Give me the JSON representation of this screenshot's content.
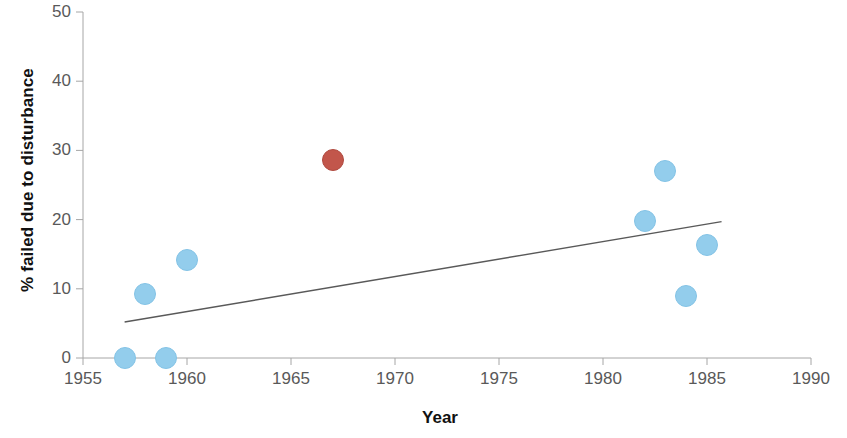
{
  "chart_data": {
    "type": "scatter",
    "title": "",
    "xlabel": "Year",
    "ylabel": "% failed due to disturbance",
    "xlim": [
      1955,
      1990
    ],
    "ylim": [
      0,
      50
    ],
    "xticks": [
      "1955",
      "1960",
      "1965",
      "1970",
      "1975",
      "1980",
      "1985",
      "1990"
    ],
    "xtick_values": [
      1955,
      1960,
      1965,
      1970,
      1975,
      1980,
      1985,
      1990
    ],
    "yticks": [
      "0",
      "10",
      "20",
      "30",
      "40",
      "50"
    ],
    "ytick_values": [
      0,
      10,
      20,
      30,
      40,
      50
    ],
    "grid": false,
    "legend": "none",
    "series": [
      {
        "name": "primary",
        "color": "#93cdec",
        "marker": "circle",
        "points": [
          {
            "x": 1957,
            "y": 0
          },
          {
            "x": 1959,
            "y": 0
          },
          {
            "x": 1958,
            "y": 9.2
          },
          {
            "x": 1960,
            "y": 14.2
          },
          {
            "x": 1982,
            "y": 19.8
          },
          {
            "x": 1983,
            "y": 27.0
          },
          {
            "x": 1984,
            "y": 8.9
          },
          {
            "x": 1985,
            "y": 16.3
          }
        ]
      },
      {
        "name": "highlighted",
        "color": "#c2564b",
        "marker": "circle",
        "points": [
          {
            "x": 1967,
            "y": 28.6
          }
        ]
      }
    ],
    "trendline": {
      "name": "linear-trend",
      "color": "#595959",
      "x_start": 1957,
      "y_start": 5.2,
      "x_end": 1985.7,
      "y_end": 19.7
    }
  },
  "axis": {
    "x_title": "Year",
    "y_title": "% failed due to disturbance"
  }
}
